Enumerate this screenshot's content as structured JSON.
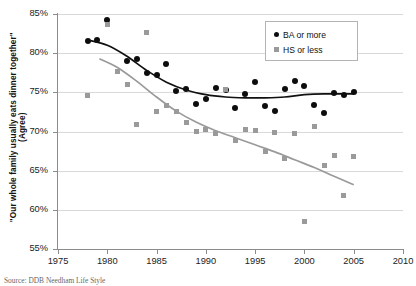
{
  "chart_data": {
    "type": "scatter",
    "title": "",
    "xlabel": "",
    "ylabel": "\"Our whole family usually eats dinner together\"",
    "ylabel_sub": "(Agree)",
    "xlim": [
      1975,
      2010
    ],
    "ylim": [
      55,
      85
    ],
    "xticks": [
      1975,
      1980,
      1985,
      1990,
      1995,
      2000,
      2005,
      2010
    ],
    "xtick_labels": [
      "1975",
      "1980",
      "1985",
      "1990",
      "1995",
      "2000",
      "2005",
      "2010"
    ],
    "yticks": [
      55,
      60,
      65,
      70,
      75,
      80,
      85
    ],
    "ytick_labels": [
      "55%",
      "60%",
      "65%",
      "70%",
      "75%",
      "80%",
      "85%"
    ],
    "grid": "horizontal",
    "legend_position": "top-right",
    "series": [
      {
        "name": "BA or more",
        "marker": "circle",
        "color": "#0d0d0d",
        "points": [
          [
            1978,
            81.5
          ],
          [
            1979,
            81.7
          ],
          [
            1980,
            84.2
          ],
          [
            1982,
            79.0
          ],
          [
            1983,
            79.2
          ],
          [
            1984,
            77.5
          ],
          [
            1985,
            77.2
          ],
          [
            1986,
            78.6
          ],
          [
            1987,
            75.2
          ],
          [
            1988,
            75.4
          ],
          [
            1989,
            73.5
          ],
          [
            1990,
            74.1
          ],
          [
            1991,
            75.5
          ],
          [
            1992,
            75.3
          ],
          [
            1993,
            73.0
          ],
          [
            1994,
            74.8
          ],
          [
            1995,
            76.3
          ],
          [
            1996,
            73.3
          ],
          [
            1997,
            72.6
          ],
          [
            1998,
            75.4
          ],
          [
            1999,
            76.5
          ],
          [
            2000,
            75.8
          ],
          [
            2001,
            73.4
          ],
          [
            2002,
            72.4
          ],
          [
            2003,
            74.9
          ],
          [
            2004,
            74.7
          ],
          [
            2005,
            75.1
          ]
        ],
        "trend": [
          [
            1978.3,
            81.6
          ],
          [
            1980,
            81.0
          ],
          [
            1982,
            79.6
          ],
          [
            1984,
            77.8
          ],
          [
            1986,
            76.3
          ],
          [
            1988,
            75.3
          ],
          [
            1990,
            74.7
          ],
          [
            1992,
            74.4
          ],
          [
            1994,
            74.3
          ],
          [
            1996,
            74.3
          ],
          [
            1998,
            74.4
          ],
          [
            2000,
            74.7
          ],
          [
            2002,
            74.8
          ],
          [
            2004,
            74.8
          ],
          [
            2005,
            74.8
          ]
        ]
      },
      {
        "name": "HS or less",
        "marker": "square",
        "color": "#9a9a9a",
        "points": [
          [
            1978,
            74.6
          ],
          [
            1980,
            83.6
          ],
          [
            1981,
            77.6
          ],
          [
            1982,
            76.0
          ],
          [
            1983,
            70.9
          ],
          [
            1984,
            82.6
          ],
          [
            1985,
            72.5
          ],
          [
            1986,
            73.3
          ],
          [
            1987,
            72.6
          ],
          [
            1988,
            71.2
          ],
          [
            1989,
            70.0
          ],
          [
            1990,
            70.3
          ],
          [
            1991,
            69.7
          ],
          [
            1992,
            75.4
          ],
          [
            1993,
            68.8
          ],
          [
            1994,
            70.2
          ],
          [
            1995,
            70.1
          ],
          [
            1996,
            67.5
          ],
          [
            1997,
            69.9
          ],
          [
            1998,
            66.5
          ],
          [
            1999,
            69.8
          ],
          [
            2000,
            58.5
          ],
          [
            2001,
            70.7
          ],
          [
            2002,
            65.6
          ],
          [
            2003,
            67.0
          ],
          [
            2004,
            61.8
          ],
          [
            2005,
            66.8
          ]
        ],
        "trend": [
          [
            1979.2,
            79.3
          ],
          [
            1981,
            78.2
          ],
          [
            1983,
            76.4
          ],
          [
            1985,
            74.4
          ],
          [
            1987,
            72.6
          ],
          [
            1989,
            71.2
          ],
          [
            1991,
            70.1
          ],
          [
            1993,
            69.2
          ],
          [
            1995,
            68.3
          ],
          [
            1997,
            67.4
          ],
          [
            1999,
            66.4
          ],
          [
            2001,
            65.4
          ],
          [
            2003,
            64.3
          ],
          [
            2005,
            63.2
          ]
        ]
      }
    ]
  },
  "legend": {
    "entries": [
      {
        "label": "BA or more",
        "marker": "circle"
      },
      {
        "label": "HS or less",
        "marker": "square"
      }
    ]
  },
  "source": {
    "text": "Source: DDB Needham Life Style"
  }
}
